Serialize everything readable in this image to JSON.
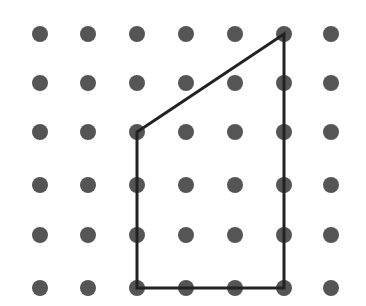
{
  "diagram": {
    "type": "dot-grid-polygon",
    "grid": {
      "columns": 7,
      "rows": 6,
      "x_positions": [
        40,
        88,
        137,
        186,
        235,
        284,
        331
      ],
      "y_positions": [
        34,
        83,
        132,
        185,
        235,
        288
      ],
      "dot_radius": 8,
      "dot_color": "#555555"
    },
    "polygon": {
      "shape": "trapezoid",
      "stroke_color": "#222222",
      "stroke_width": 3,
      "vertices_grid": [
        [
          2,
          2
        ],
        [
          5,
          0
        ],
        [
          5,
          5
        ],
        [
          2,
          5
        ]
      ]
    }
  }
}
